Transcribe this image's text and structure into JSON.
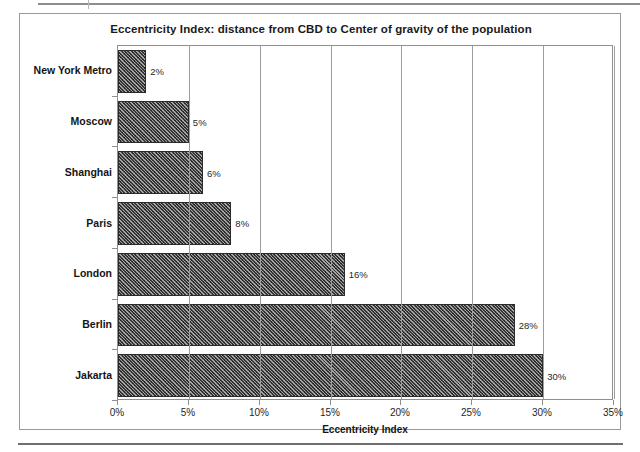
{
  "chart_data": {
    "type": "bar",
    "orientation": "horizontal",
    "title": "Eccentricity Index: distance from CBD to Center of gravity of the population",
    "xlabel": "Eccentricity Index",
    "ylabel": "",
    "categories": [
      "New York Metro",
      "Moscow",
      "Shanghai",
      "Paris",
      "London",
      "Berlin",
      "Jakarta"
    ],
    "values": [
      2,
      5,
      6,
      8,
      16,
      28,
      30
    ],
    "data_labels": [
      "2%",
      "5%",
      "6%",
      "8%",
      "16%",
      "28%",
      "30%"
    ],
    "xlim": [
      0,
      35
    ],
    "xticks": [
      0,
      5,
      10,
      15,
      20,
      25,
      30,
      35
    ],
    "xtick_labels": [
      "0%",
      "5%",
      "10%",
      "15%",
      "20%",
      "25%",
      "30%",
      "35%"
    ],
    "grid": "vertical",
    "legend": "none",
    "bar_color": "#3c3c3c",
    "bar_pattern": "dense-diagonal-hatch"
  }
}
